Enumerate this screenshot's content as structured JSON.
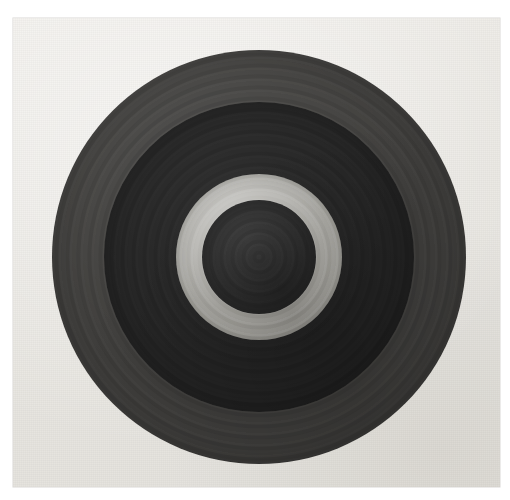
{
  "artwork": {
    "medium_description": "photographed painting on textured paper support",
    "background_color": "#ffffff",
    "canvas": {
      "name": "canvas-support",
      "left": 13,
      "top": 18,
      "width": 487,
      "height": 469,
      "base_color": "#ebe9e5",
      "highlight_color": "#f1efeb",
      "shadow_color": "#e4e2dc"
    },
    "composition": {
      "type": "concentric-circles",
      "center_x": 246,
      "center_y": 239,
      "ring_count": 4
    },
    "rings": [
      {
        "name": "ring-outer",
        "order": 1,
        "label": "outer ring",
        "radius": 207,
        "color": "#3e3d3b",
        "tone": "medium-dark gray"
      },
      {
        "name": "ring-second",
        "order": 2,
        "label": "second ring",
        "radius": 155,
        "color": "#232323",
        "tone": "very dark gray"
      },
      {
        "name": "ring-light",
        "order": 3,
        "label": "light ring",
        "radius": 83,
        "color": "#aaa9a4",
        "tone": "light gray"
      },
      {
        "name": "ring-center",
        "order": 4,
        "label": "center disc",
        "radius": 57,
        "color": "#2c2c2c",
        "tone": "dark gray"
      }
    ]
  },
  "chart_data": {
    "type": "pie",
    "title": "",
    "categories": [
      "outer ring",
      "second ring",
      "light ring",
      "center disc"
    ],
    "values": [
      207,
      155,
      83,
      57
    ],
    "colors": [
      "#3e3d3b",
      "#232323",
      "#aaa9a4",
      "#2c2c2c"
    ],
    "xlabel": "",
    "ylabel": "radius (px)",
    "legend": "none",
    "grid": false
  }
}
